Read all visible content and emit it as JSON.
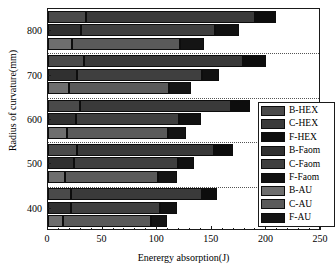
{
  "chart_data": {
    "type": "bar",
    "orientation": "horizontal",
    "stacked": true,
    "title": "",
    "xlabel": "Enerergy absorption(J)",
    "ylabel": "Radius of curvature(mm)",
    "xlim": [
      0,
      250
    ],
    "xticks": [
      0,
      50,
      100,
      150,
      200,
      250
    ],
    "xtick_labels": [
      "0",
      "50",
      "100",
      "150",
      "200",
      "250"
    ],
    "categories": [
      400,
      500,
      600,
      700,
      800
    ],
    "ytick_labels": [
      "400",
      "500",
      "600",
      "700",
      "800"
    ],
    "grid": false,
    "legend_position": "right-inside",
    "legend_entries": [
      {
        "label": "B-HEX",
        "color": "#4a4a4a"
      },
      {
        "label": "C-HEX",
        "color": "#3a3a3a"
      },
      {
        "label": "F-HEX",
        "color": "#0d0d0d"
      },
      {
        "label": "B-Faom",
        "color": "#303030"
      },
      {
        "label": "C-Faom",
        "color": "#3f3f3f"
      },
      {
        "label": "F-Faom",
        "color": "#111111"
      },
      {
        "label": "B-AU",
        "color": "#6e6e6e"
      },
      {
        "label": "C-AU",
        "color": "#5a5a5a"
      },
      {
        "label": "F-AU",
        "color": "#141414"
      }
    ],
    "series": [
      {
        "name": "B-HEX",
        "values": [
          21,
          27,
          29,
          33,
          35
        ]
      },
      {
        "name": "C-HEX",
        "values": [
          120,
          125,
          139,
          146,
          155
        ]
      },
      {
        "name": "F-HEX",
        "values": [
          14,
          17,
          17,
          21,
          19
        ]
      },
      {
        "name": "B-Faom",
        "values": [
          21,
          24,
          26,
          27,
          30
        ]
      },
      {
        "name": "C-Faom",
        "values": [
          82,
          95,
          94,
          114,
          123
        ]
      },
      {
        "name": "F-Faom",
        "values": [
          15,
          15,
          20,
          16,
          22
        ]
      },
      {
        "name": "B-AU",
        "values": [
          14,
          16,
          17,
          19,
          22
        ]
      },
      {
        "name": "C-AU",
        "values": [
          80,
          85,
          93,
          92,
          99
        ]
      },
      {
        "name": "F-AU",
        "values": [
          15,
          17,
          16,
          20,
          22
        ]
      }
    ],
    "bars": [
      {
        "group": 800,
        "row": "HEX",
        "segments": [
          {
            "name": "B-HEX",
            "value": 35,
            "start": 0,
            "end": 35
          },
          {
            "name": "C-HEX",
            "value": 155,
            "start": 35,
            "end": 190
          },
          {
            "name": "F-HEX",
            "value": 19,
            "start": 190,
            "end": 209
          }
        ]
      },
      {
        "group": 800,
        "row": "Faom",
        "segments": [
          {
            "name": "B-Faom",
            "value": 30,
            "start": 0,
            "end": 30
          },
          {
            "name": "C-Faom",
            "value": 123,
            "start": 30,
            "end": 153
          },
          {
            "name": "F-Faom",
            "value": 22,
            "start": 153,
            "end": 175
          }
        ]
      },
      {
        "group": 800,
        "row": "AU",
        "segments": [
          {
            "name": "B-AU",
            "value": 22,
            "start": 0,
            "end": 22
          },
          {
            "name": "C-AU",
            "value": 99,
            "start": 22,
            "end": 121
          },
          {
            "name": "F-AU",
            "value": 22,
            "start": 121,
            "end": 143
          }
        ]
      },
      {
        "group": 700,
        "row": "HEX",
        "segments": [
          {
            "name": "B-HEX",
            "value": 33,
            "start": 0,
            "end": 33
          },
          {
            "name": "C-HEX",
            "value": 146,
            "start": 33,
            "end": 179
          },
          {
            "name": "F-HEX",
            "value": 21,
            "start": 179,
            "end": 200
          }
        ]
      },
      {
        "group": 700,
        "row": "Faom",
        "segments": [
          {
            "name": "B-Faom",
            "value": 27,
            "start": 0,
            "end": 27
          },
          {
            "name": "C-Faom",
            "value": 114,
            "start": 27,
            "end": 141
          },
          {
            "name": "F-Faom",
            "value": 16,
            "start": 141,
            "end": 157
          }
        ]
      },
      {
        "group": 700,
        "row": "AU",
        "segments": [
          {
            "name": "B-AU",
            "value": 19,
            "start": 0,
            "end": 19
          },
          {
            "name": "C-AU",
            "value": 92,
            "start": 19,
            "end": 111
          },
          {
            "name": "F-AU",
            "value": 20,
            "start": 111,
            "end": 131
          }
        ]
      },
      {
        "group": 600,
        "row": "HEX",
        "segments": [
          {
            "name": "B-HEX",
            "value": 29,
            "start": 0,
            "end": 29
          },
          {
            "name": "C-HEX",
            "value": 139,
            "start": 29,
            "end": 168
          },
          {
            "name": "F-HEX",
            "value": 17,
            "start": 168,
            "end": 185
          }
        ]
      },
      {
        "group": 600,
        "row": "Faom",
        "segments": [
          {
            "name": "B-Faom",
            "value": 26,
            "start": 0,
            "end": 26
          },
          {
            "name": "C-Faom",
            "value": 94,
            "start": 26,
            "end": 120
          },
          {
            "name": "F-Faom",
            "value": 20,
            "start": 120,
            "end": 140
          }
        ]
      },
      {
        "group": 600,
        "row": "AU",
        "segments": [
          {
            "name": "B-AU",
            "value": 17,
            "start": 0,
            "end": 17
          },
          {
            "name": "C-AU",
            "value": 93,
            "start": 17,
            "end": 110
          },
          {
            "name": "F-AU",
            "value": 16,
            "start": 110,
            "end": 126
          }
        ]
      },
      {
        "group": 500,
        "row": "HEX",
        "segments": [
          {
            "name": "B-HEX",
            "value": 27,
            "start": 0,
            "end": 27
          },
          {
            "name": "C-HEX",
            "value": 125,
            "start": 27,
            "end": 152
          },
          {
            "name": "F-HEX",
            "value": 17,
            "start": 152,
            "end": 169
          }
        ]
      },
      {
        "group": 500,
        "row": "Faom",
        "segments": [
          {
            "name": "B-Faom",
            "value": 24,
            "start": 0,
            "end": 24
          },
          {
            "name": "C-Faom",
            "value": 95,
            "start": 24,
            "end": 119
          },
          {
            "name": "F-Faom",
            "value": 15,
            "start": 119,
            "end": 134
          }
        ]
      },
      {
        "group": 500,
        "row": "AU",
        "segments": [
          {
            "name": "B-AU",
            "value": 16,
            "start": 0,
            "end": 16
          },
          {
            "name": "C-AU",
            "value": 85,
            "start": 16,
            "end": 101
          },
          {
            "name": "F-AU",
            "value": 17,
            "start": 101,
            "end": 118
          }
        ]
      },
      {
        "group": 400,
        "row": "HEX",
        "segments": [
          {
            "name": "B-HEX",
            "value": 21,
            "start": 0,
            "end": 21
          },
          {
            "name": "C-HEX",
            "value": 120,
            "start": 21,
            "end": 141
          },
          {
            "name": "F-HEX",
            "value": 14,
            "start": 141,
            "end": 155
          }
        ]
      },
      {
        "group": 400,
        "row": "Faom",
        "segments": [
          {
            "name": "B-Faom",
            "value": 21,
            "start": 0,
            "end": 21
          },
          {
            "name": "C-Faom",
            "value": 82,
            "start": 21,
            "end": 103
          },
          {
            "name": "F-Faom",
            "value": 15,
            "start": 103,
            "end": 118
          }
        ]
      },
      {
        "group": 400,
        "row": "AU",
        "segments": [
          {
            "name": "B-AU",
            "value": 14,
            "start": 0,
            "end": 14
          },
          {
            "name": "C-AU",
            "value": 80,
            "start": 14,
            "end": 94
          },
          {
            "name": "F-AU",
            "value": 15,
            "start": 94,
            "end": 109
          }
        ]
      }
    ]
  }
}
